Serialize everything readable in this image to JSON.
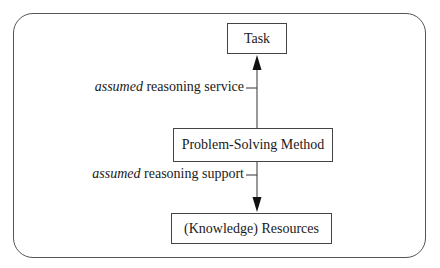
{
  "diagram": {
    "nodes": {
      "task": "Task",
      "psm": "Problem-Solving Method",
      "resources": "(Knowledge) Resources"
    },
    "edges": {
      "upper": {
        "italic": "assumed",
        "rest": " reasoning service",
        "from": "Problem-Solving Method",
        "to": "Task"
      },
      "lower": {
        "italic": "assumed",
        "rest": " reasoning support",
        "from": "Problem-Solving Method",
        "to": "(Knowledge) Resources"
      }
    }
  }
}
